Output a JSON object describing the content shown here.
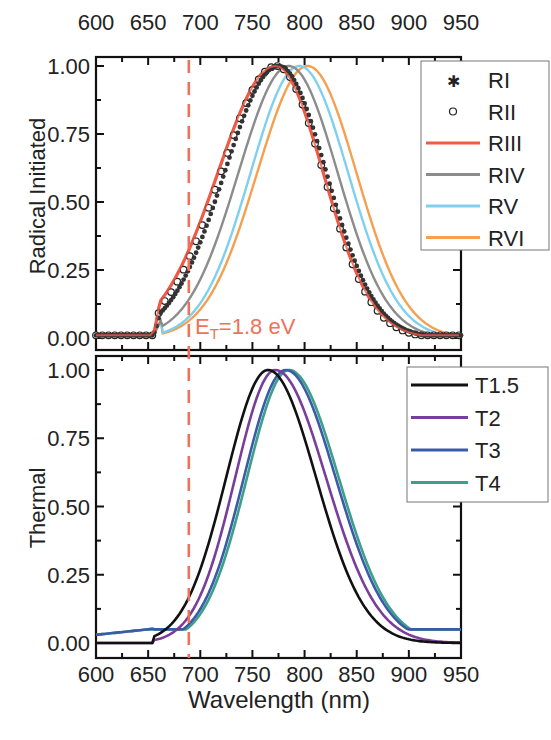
{
  "chart_data": [
    {
      "type": "line",
      "panel": "top",
      "ylabel": "Radical Initiated",
      "xlabel": "",
      "top_axis_ticks": [
        "600",
        "650",
        "700",
        "750",
        "800",
        "850",
        "900",
        "950"
      ],
      "xlim": [
        600,
        950
      ],
      "ylim": [
        0,
        1
      ],
      "yticks": [
        "0.00",
        "0.25",
        "0.50",
        "0.75",
        "1.00"
      ],
      "legend_position": "upper right",
      "annotation": {
        "text_main": "E",
        "text_sub": "T",
        "text_rest": "=1.8 eV",
        "x": 689,
        "color": "#f0715a"
      },
      "series": [
        {
          "name": "RI",
          "style": "star-marker",
          "color": "#333333",
          "peak_x": 775,
          "onset": 655,
          "sigma_l": 62,
          "sigma_r": 55
        },
        {
          "name": "RII",
          "style": "open-circle",
          "color": "#222222",
          "peak_x": 773,
          "onset": 655,
          "sigma_l": 64,
          "sigma_r": 54
        },
        {
          "name": "RIII",
          "style": "line",
          "color": "#f05a46",
          "peak_x": 772,
          "onset": 655,
          "sigma_l": 66,
          "sigma_r": 55
        },
        {
          "name": "RIV",
          "style": "line",
          "color": "#8c8c8c",
          "peak_x": 785,
          "onset": 655,
          "sigma_l": 58,
          "sigma_r": 56
        },
        {
          "name": "RV",
          "style": "line",
          "color": "#7fd0f0",
          "peak_x": 795,
          "onset": 655,
          "sigma_l": 56,
          "sigma_r": 56
        },
        {
          "name": "RVI",
          "style": "line",
          "color": "#f5a050",
          "peak_x": 803,
          "onset": 655,
          "sigma_l": 58,
          "sigma_r": 56
        }
      ]
    },
    {
      "type": "line",
      "panel": "bottom",
      "ylabel": "Thermal",
      "xlabel": "Wavelength (nm)",
      "xticks": [
        "600",
        "650",
        "700",
        "750",
        "800",
        "850",
        "900",
        "950"
      ],
      "xlim": [
        600,
        950
      ],
      "ylim": [
        0,
        1
      ],
      "yticks": [
        "0.00",
        "0.25",
        "0.50",
        "0.75",
        "1.00"
      ],
      "legend_position": "upper right",
      "series": [
        {
          "name": "T1.5",
          "color": "#111111",
          "peak_x": 765,
          "sigma_l": 48,
          "sigma_r": 55,
          "base": 0.0
        },
        {
          "name": "T2",
          "color": "#7a3d9a",
          "peak_x": 772,
          "sigma_l": 46,
          "sigma_r": 58,
          "base": 0.0
        },
        {
          "name": "T3",
          "color": "#3d5aa8",
          "peak_x": 782,
          "sigma_l": 48,
          "sigma_r": 57,
          "base": 0.03
        },
        {
          "name": "T4",
          "color": "#3aa08a",
          "peak_x": 785,
          "sigma_l": 48,
          "sigma_r": 57,
          "base": 0.03
        }
      ]
    }
  ],
  "labels": {
    "top_ylabel": "Radical Initiated",
    "bottom_ylabel": "Thermal",
    "xlabel": "Wavelength (nm)",
    "annotation_E": "E",
    "annotation_sub": "T",
    "annotation_rest": "=1.8 eV"
  }
}
